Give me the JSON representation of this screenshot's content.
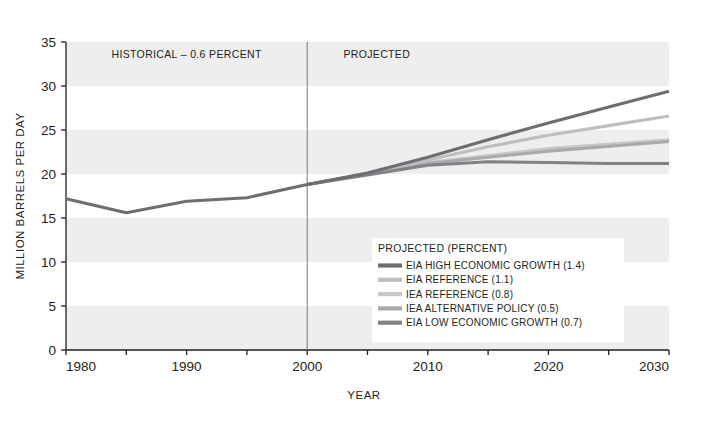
{
  "chart_data": {
    "type": "line",
    "title": "",
    "xlabel": "YEAR",
    "ylabel": "MILLION BARRELS PER DAY",
    "xlim": [
      1980,
      2030
    ],
    "ylim": [
      0,
      35
    ],
    "x_ticks": [
      1980,
      1990,
      2000,
      2010,
      2020,
      2030
    ],
    "x_minor_ticks": [
      1985,
      1995,
      2005,
      2015,
      2025
    ],
    "y_ticks": [
      0,
      5,
      10,
      15,
      20,
      25,
      30,
      35
    ],
    "grid": false,
    "banded_background": true,
    "band_ranges": [
      [
        0,
        5
      ],
      [
        10,
        15
      ],
      [
        20,
        25
      ],
      [
        30,
        35
      ]
    ],
    "band_color": "#eeeeef",
    "divider_year": 2000,
    "annotations": [
      {
        "text": "HISTORICAL – 0.6 PERCENT",
        "x": 1990,
        "y": 33.2,
        "align": "middle"
      },
      {
        "text": "PROJECTED",
        "x": 2003,
        "y": 33.2,
        "align": "start"
      }
    ],
    "legend": {
      "position": "inside-lower-right",
      "title": "PROJECTED (PERCENT)"
    },
    "series": [
      {
        "name": "EIA HIGH ECONOMIC GROWTH (1.4)",
        "color": "#6d6e71",
        "x": [
          2000,
          2005,
          2010,
          2015,
          2020,
          2025,
          2030
        ],
        "values": [
          18.8,
          20.1,
          21.9,
          23.9,
          25.8,
          27.6,
          29.4
        ]
      },
      {
        "name": "EIA REFERENCE (1.1)",
        "color": "#bcbec0",
        "x": [
          2000,
          2005,
          2010,
          2015,
          2020,
          2025,
          2030
        ],
        "values": [
          18.8,
          20.0,
          21.6,
          23.1,
          24.4,
          25.5,
          26.6
        ]
      },
      {
        "name": "IEA REFERENCE (0.8)",
        "color": "#c7c8ca",
        "x": [
          2000,
          2010,
          2020,
          2030
        ],
        "values": [
          18.8,
          21.3,
          22.9,
          23.9
        ]
      },
      {
        "name": "IEA ALTERNATIVE POLICY (0.5)",
        "color": "#a7a9ac",
        "x": [
          2000,
          2010,
          2020,
          2030
        ],
        "values": [
          18.8,
          21.2,
          22.6,
          23.7
        ]
      },
      {
        "name": "EIA LOW ECONOMIC GROWTH (0.7)",
        "color": "#808285",
        "x": [
          2000,
          2005,
          2010,
          2015,
          2020,
          2025,
          2030
        ],
        "values": [
          18.8,
          19.9,
          21.0,
          21.4,
          21.3,
          21.2,
          21.2
        ]
      },
      {
        "name": "HISTORICAL",
        "color": "#6d6e71",
        "historical": true,
        "x": [
          1980,
          1985,
          1990,
          1995,
          2000
        ],
        "values": [
          17.2,
          15.6,
          16.9,
          17.3,
          18.8
        ]
      }
    ],
    "legend_entries": [
      {
        "label": "EIA HIGH ECONOMIC GROWTH (1.4)",
        "color": "#6d6e71"
      },
      {
        "label": "EIA REFERENCE (1.1)",
        "color": "#bcbec0"
      },
      {
        "label": "IEA REFERENCE (0.8)",
        "color": "#c7c8ca"
      },
      {
        "label": "IEA ALTERNATIVE POLICY (0.5)",
        "color": "#a7a9ac"
      },
      {
        "label": "EIA LOW ECONOMIC GROWTH (0.7)",
        "color": "#808285"
      }
    ]
  },
  "axis": {
    "x_title": "YEAR",
    "y_title": "MILLION BARRELS PER DAY",
    "y_tick_labels": [
      "35",
      "30",
      "25",
      "20",
      "15",
      "10",
      "5",
      "0"
    ],
    "x_tick_labels": [
      "1980",
      "1990",
      "2000",
      "2010",
      "2020",
      "2030"
    ]
  },
  "labels": {
    "historical": "HISTORICAL – 0.6 PERCENT",
    "projected": "PROJECTED",
    "legend_title": "PROJECTED (PERCENT)"
  }
}
